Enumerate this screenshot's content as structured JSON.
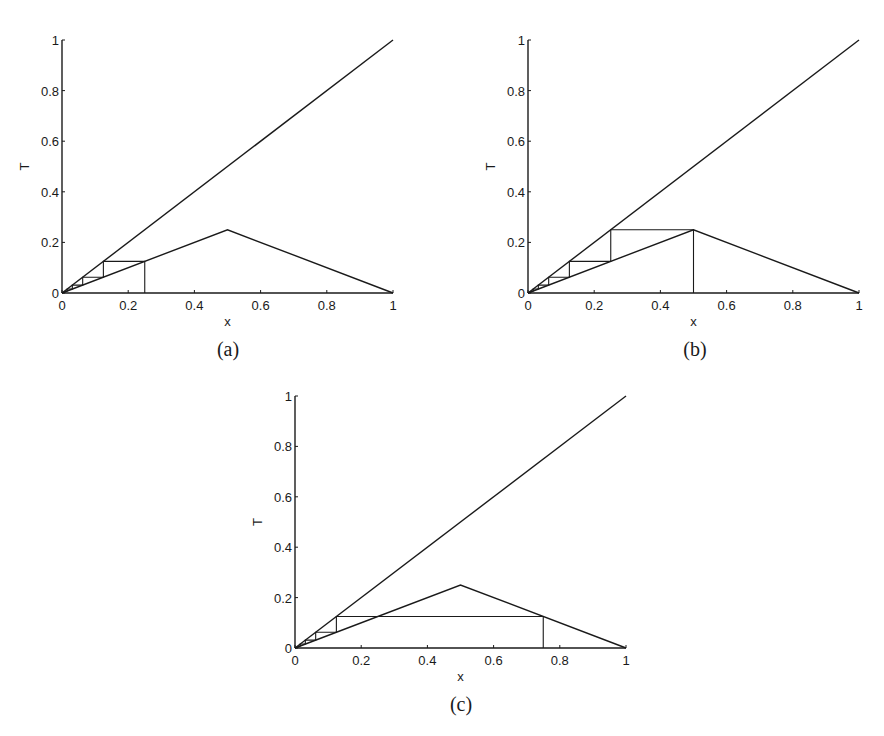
{
  "chart_data": [
    {
      "id": "a",
      "type": "line",
      "caption": "(a)",
      "xlabel": "x",
      "ylabel": "T",
      "xlim": [
        0,
        1
      ],
      "ylim": [
        0,
        1
      ],
      "xticks": [
        "0",
        "0.2",
        "0.4",
        "0.6",
        "0.8",
        "1"
      ],
      "yticks": [
        "0",
        "0.2",
        "0.4",
        "0.6",
        "0.8",
        "1"
      ],
      "grid": false,
      "series": [
        {
          "name": "identity line y=x",
          "x": [
            0,
            1
          ],
          "y": [
            0,
            1
          ]
        },
        {
          "name": "map T(x)",
          "x": [
            0,
            0.5,
            1
          ],
          "y": [
            0,
            0.25,
            0
          ]
        },
        {
          "name": "cobweb iteration",
          "x": [
            0.25,
            0.25,
            0.125,
            0.125,
            0.0625,
            0.0625,
            0.03125,
            0.03125,
            0.015625,
            0.015625,
            0
          ],
          "y": [
            0,
            0.125,
            0.125,
            0.0625,
            0.0625,
            0.03125,
            0.03125,
            0.015625,
            0.015625,
            0.0078125,
            0
          ]
        }
      ],
      "box": {
        "left": 62,
        "right": 393,
        "top": 40,
        "bottom": 293
      }
    },
    {
      "id": "b",
      "type": "line",
      "caption": "(b)",
      "xlabel": "x",
      "ylabel": "T",
      "xlim": [
        0,
        1
      ],
      "ylim": [
        0,
        1
      ],
      "xticks": [
        "0",
        "0.2",
        "0.4",
        "0.6",
        "0.8",
        "1"
      ],
      "yticks": [
        "0",
        "0.2",
        "0.4",
        "0.6",
        "0.8",
        "1"
      ],
      "grid": false,
      "series": [
        {
          "name": "identity line y=x",
          "x": [
            0,
            1
          ],
          "y": [
            0,
            1
          ]
        },
        {
          "name": "map T(x)",
          "x": [
            0,
            0.5,
            1
          ],
          "y": [
            0,
            0.25,
            0
          ]
        },
        {
          "name": "cobweb iteration",
          "x": [
            0.5,
            0.5,
            0.25,
            0.25,
            0.125,
            0.125,
            0.0625,
            0.0625,
            0.03125,
            0.03125,
            0.015625,
            0.015625,
            0
          ],
          "y": [
            0,
            0.25,
            0.25,
            0.125,
            0.125,
            0.0625,
            0.0625,
            0.03125,
            0.03125,
            0.015625,
            0.015625,
            0.0078125,
            0
          ]
        }
      ],
      "box": {
        "left": 528,
        "right": 859,
        "top": 40,
        "bottom": 293
      }
    },
    {
      "id": "c",
      "type": "line",
      "caption": "(c)",
      "xlabel": "x",
      "ylabel": "T",
      "xlim": [
        0,
        1
      ],
      "ylim": [
        0,
        1
      ],
      "xticks": [
        "0",
        "0.2",
        "0.4",
        "0.6",
        "0.8",
        "1"
      ],
      "yticks": [
        "0",
        "0.2",
        "0.4",
        "0.6",
        "0.8",
        "1"
      ],
      "grid": false,
      "series": [
        {
          "name": "identity line y=x",
          "x": [
            0,
            1
          ],
          "y": [
            0,
            1
          ]
        },
        {
          "name": "map T(x)",
          "x": [
            0,
            0.5,
            1
          ],
          "y": [
            0,
            0.25,
            0
          ]
        },
        {
          "name": "cobweb iteration",
          "x": [
            0.75,
            0.75,
            0.125,
            0.125,
            0.0625,
            0.0625,
            0.03125,
            0.03125,
            0.015625,
            0.015625,
            0
          ],
          "y": [
            0,
            0.125,
            0.125,
            0.0625,
            0.0625,
            0.03125,
            0.03125,
            0.015625,
            0.015625,
            0.0078125,
            0
          ]
        }
      ],
      "box": {
        "left": 295,
        "right": 626,
        "top": 396,
        "bottom": 648
      }
    }
  ],
  "colors": {
    "line": "#1a1a1a",
    "background": "#ffffff"
  }
}
